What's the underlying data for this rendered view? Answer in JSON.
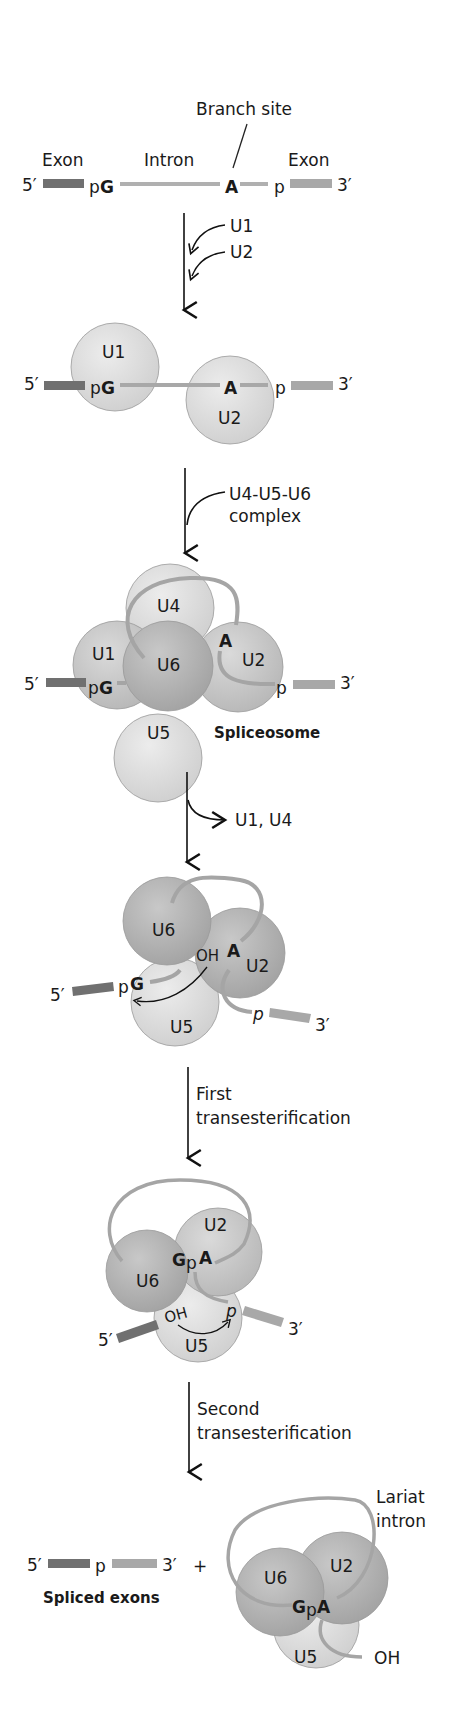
{
  "colors": {
    "exon5": "#707070",
    "exon3": "#a8a8a8",
    "intron": "#b0b0b0",
    "snrnp_light": "#dcdcdc",
    "snrnp_mid": "#c4c4c4",
    "snrnp_dark": "#a9a9a9",
    "text": "#1a1a1a"
  },
  "stage1": {
    "branch_site": "Branch site",
    "exon_left": "Exon",
    "intron": "Intron",
    "exon_right": "Exon",
    "five_prime": "5′",
    "three_prime": "3′",
    "pG_p": "p",
    "pG_G": "G",
    "A": "A",
    "p": "p"
  },
  "step1": {
    "added": [
      "U1",
      "U2"
    ]
  },
  "stage2": {
    "U1": "U1",
    "U2": "U2",
    "five_prime": "5′",
    "three_prime": "3′",
    "pG_p": "p",
    "pG_G": "G",
    "A": "A",
    "p": "p"
  },
  "step2": {
    "line1": "U4-U5-U6",
    "line2": "complex"
  },
  "stage3": {
    "U1": "U1",
    "U2": "U2",
    "U4": "U4",
    "U5": "U5",
    "U6": "U6",
    "A": "A",
    "pG_p": "p",
    "pG_G": "G",
    "p": "p",
    "five_prime": "5′",
    "three_prime": "3′",
    "label": "Spliceosome"
  },
  "step3": {
    "released": "U1, U4"
  },
  "stage4": {
    "U6": "U6",
    "U2": "U2",
    "U5": "U5",
    "OH": "OH",
    "A": "A",
    "pG_p": "p",
    "pG_G": "G",
    "p": "p",
    "five_prime": "5′",
    "three_prime": "3′"
  },
  "step4": {
    "line1": "First",
    "line2": "transesterification"
  },
  "stage5": {
    "U6": "U6",
    "U2": "U2",
    "U5": "U5",
    "G": "G",
    "p_mid": "p",
    "A": "A",
    "OH": "OH",
    "p": "p",
    "five_prime": "5′",
    "three_prime": "3′"
  },
  "step5": {
    "line1": "Second",
    "line2": "transesterification"
  },
  "stage6": {
    "five_prime": "5′",
    "p": "p",
    "three_prime": "3′",
    "plus": "+",
    "spliced_label": "Spliced exons",
    "U6": "U6",
    "U2": "U2",
    "U5": "U5",
    "GpA_G": "G",
    "GpA_p": "p",
    "GpA_A": "A",
    "OH": "OH",
    "lariat_line1": "Lariat",
    "lariat_line2": "intron"
  }
}
